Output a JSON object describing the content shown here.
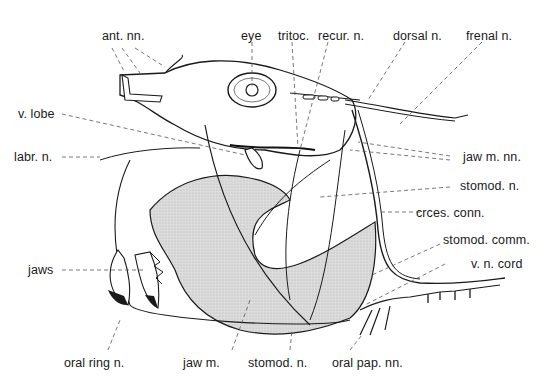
{
  "figure": {
    "type": "anatomical-illustration",
    "colors": {
      "ink": "#1a1a1a",
      "stipple": "#d4d4d4",
      "leader": "#555555",
      "background": "#ffffff"
    }
  },
  "labels": {
    "top": [
      {
        "id": "ant-nn",
        "text": "ant. nn."
      },
      {
        "id": "eye",
        "text": "eye"
      },
      {
        "id": "tritoc",
        "text": "tritoc."
      },
      {
        "id": "recur-n",
        "text": "recur. n."
      },
      {
        "id": "dorsal-n",
        "text": "dorsal n."
      },
      {
        "id": "frenal-n",
        "text": "frenal n."
      }
    ],
    "left": [
      {
        "id": "v-lobe",
        "text": "v. lobe"
      },
      {
        "id": "labr-n",
        "text": "labr. n."
      },
      {
        "id": "jaws",
        "text": "jaws"
      }
    ],
    "right": [
      {
        "id": "jaw-m-nn",
        "text": "jaw m. nn."
      },
      {
        "id": "stomod-n-right",
        "text": "stomod. n."
      },
      {
        "id": "crces-conn",
        "text": "crces. conn."
      },
      {
        "id": "stomod-comm",
        "text": "stomod. comm."
      },
      {
        "id": "v-n-cord",
        "text": "v. n. cord"
      }
    ],
    "bottom": [
      {
        "id": "oral-ring-n",
        "text": "oral ring n."
      },
      {
        "id": "jaw-m",
        "text": "jaw m."
      },
      {
        "id": "stomod-n-bottom",
        "text": "stomod. n."
      },
      {
        "id": "oral-pap-nn",
        "text": "oral pap. nn."
      }
    ]
  }
}
